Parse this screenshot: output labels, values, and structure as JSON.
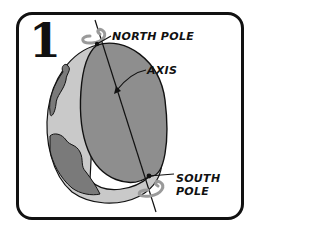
{
  "panel": {
    "number": "1",
    "labels": {
      "north_pole": "NORTH POLE",
      "axis": "AXIS",
      "south_pole_line1": "SOUTH",
      "south_pole_line2": "POLE"
    }
  },
  "colors": {
    "frame": "#111111",
    "globe_light": "#c9c9c9",
    "globe_dark": "#8e8e8e",
    "continent": "#7a7a7a",
    "rotation_arrow": "#9a9a9a",
    "background": "#ffffff"
  }
}
